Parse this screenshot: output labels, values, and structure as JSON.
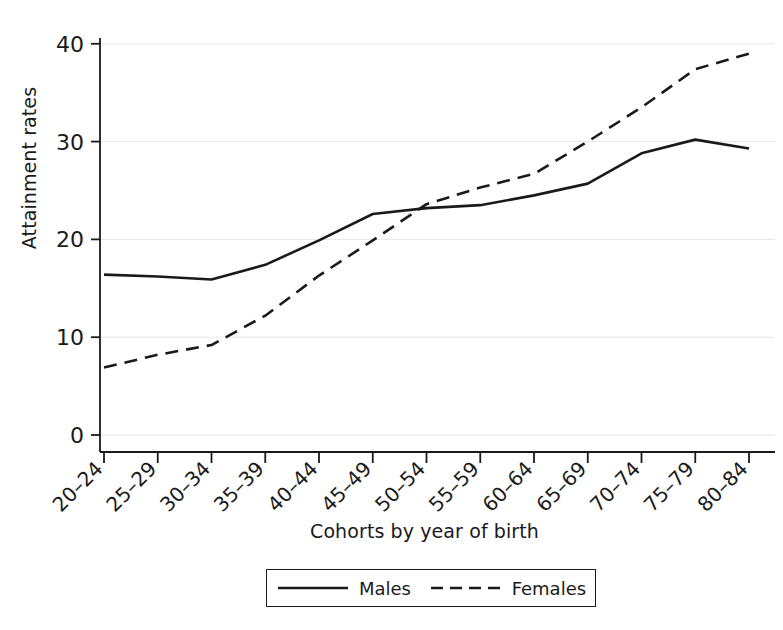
{
  "chart_data": {
    "type": "line",
    "title": "",
    "xlabel": "Cohorts by year of birth",
    "ylabel": "Attainment rates",
    "categories": [
      "20–24",
      "25–29",
      "30–34",
      "35–39",
      "40–44",
      "45–49",
      "50–54",
      "55–59",
      "60–64",
      "65–69",
      "70–74",
      "75–79",
      "80–84"
    ],
    "series": [
      {
        "name": "Males",
        "style": "solid",
        "color": "#1a1a1a",
        "values": [
          16.4,
          16.2,
          15.9,
          17.4,
          19.9,
          22.6,
          23.2,
          23.5,
          24.5,
          25.7,
          28.8,
          30.2,
          29.3
        ]
      },
      {
        "name": "Females",
        "style": "dashed",
        "color": "#1a1a1a",
        "values": [
          6.9,
          8.2,
          9.2,
          12.2,
          16.3,
          19.9,
          23.6,
          25.3,
          26.7,
          30.0,
          33.5,
          37.4,
          39.0
        ]
      }
    ],
    "ylim": [
      0,
      41
    ],
    "yticks": [
      0,
      10,
      20,
      30,
      40
    ],
    "ytick_labels": [
      "0",
      "10",
      "20",
      "30",
      "40"
    ],
    "grid": true,
    "grid_axis": "y",
    "grid_color": "#e8e8e8",
    "legend_position": "bottom",
    "legend_entries": [
      "Males",
      "Females"
    ],
    "axis_color": "#1a1a1a",
    "background": "#ffffff"
  },
  "legend": {
    "males_label": "Males",
    "females_label": "Females"
  },
  "axes": {
    "y_title": "Attainment rates",
    "x_title": "Cohorts by year of birth"
  }
}
